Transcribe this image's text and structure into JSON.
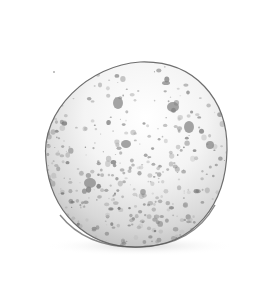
{
  "image": {
    "subject": "Pencil drawing of a speckled egg",
    "background_color": "#ffffff",
    "egg": {
      "outline_color": "#6e6e6e",
      "fill_color": "#f6f6f6",
      "shadow_color": "#d9d9d9",
      "speckle_color": "#8c8c8c",
      "large_spots": [
        {
          "cx": 118,
          "cy": 103,
          "rx": 5,
          "ry": 6
        },
        {
          "cx": 173,
          "cy": 107,
          "rx": 6,
          "ry": 5
        },
        {
          "cx": 189,
          "cy": 127,
          "rx": 5,
          "ry": 6
        },
        {
          "cx": 126,
          "cy": 144,
          "rx": 5,
          "ry": 4
        },
        {
          "cx": 90,
          "cy": 183,
          "rx": 6,
          "ry": 5
        },
        {
          "cx": 166,
          "cy": 83,
          "rx": 4,
          "ry": 2
        },
        {
          "cx": 210,
          "cy": 145,
          "rx": 4,
          "ry": 4
        }
      ]
    },
    "stray_mark": {
      "cx": 54,
      "cy": 72
    }
  }
}
